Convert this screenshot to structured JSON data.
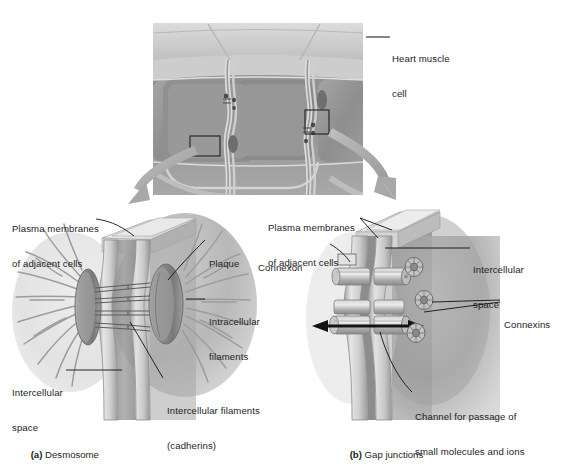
{
  "figure": {
    "type": "biology-diagram",
    "title_text_present": false,
    "micrograph": {
      "name": "cardiac-muscle-micrograph",
      "label": "Heart muscle\ncell",
      "label_line1": "Heart muscle",
      "label_line2": "cell",
      "callout_boxes": 2
    },
    "panels": [
      {
        "id": "a",
        "caption_letter": "(a)",
        "caption_text": "Desmosome",
        "caption_full": "(a) Desmosome",
        "labels": [
          {
            "name": "plasma-membranes-label",
            "text": "Plasma membranes\nof adjacent cells",
            "line1": "Plasma membranes",
            "line2": "of adjacent cells"
          },
          {
            "name": "plaque-label",
            "text": "Plaque",
            "line1": "Plaque",
            "line2": ""
          },
          {
            "name": "intracellular-filaments-label",
            "text": "Intracellular\nfilaments",
            "line1": "Intracellular",
            "line2": "filaments"
          },
          {
            "name": "intercellular-space-label",
            "text": "Intercellular\nspace",
            "line1": "Intercellular",
            "line2": "space"
          },
          {
            "name": "intercellular-filaments-label",
            "text": "Intercellular filaments\n(cadherins)",
            "line1": "Intercellular filaments",
            "line2": "(cadherins)"
          }
        ]
      },
      {
        "id": "b",
        "caption_letter": "(b)",
        "caption_text": "Gap junctions",
        "caption_full": "(b) Gap junctions",
        "labels": [
          {
            "name": "plasma-membranes-label",
            "text": "Plasma membranes\nof adjacent cells",
            "line1": "Plasma membranes",
            "line2": "of adjacent cells"
          },
          {
            "name": "connexon-label",
            "text": "Connexon",
            "line1": "Connexon",
            "line2": ""
          },
          {
            "name": "intercellular-space-label",
            "text": "Intercellular\nspace",
            "line1": "Intercellular",
            "line2": "space"
          },
          {
            "name": "connexins-label",
            "text": "Connexins",
            "line1": "Connexins",
            "line2": ""
          },
          {
            "name": "channel-label",
            "text": "Channel for passage of\nsmall molecules and ions",
            "line1": "Channel for passage of",
            "line2": "small molecules and ions"
          }
        ]
      }
    ],
    "colors": {
      "background": "#ffffff",
      "text": "#1d1d1d",
      "leader_line": "#111111",
      "arrow_gray": "#a9a9a9",
      "membrane_light": "#d8d8d8",
      "membrane_mid": "#b3b3b3",
      "membrane_dark": "#8a8a8a",
      "cytoplasm": "#9a9a9a",
      "plaque": "#8f8f8f",
      "micrograph_light": "#c9c9c9",
      "micrograph_dark": "#8d8d8d",
      "callout_box": "#2b2b2b"
    }
  }
}
